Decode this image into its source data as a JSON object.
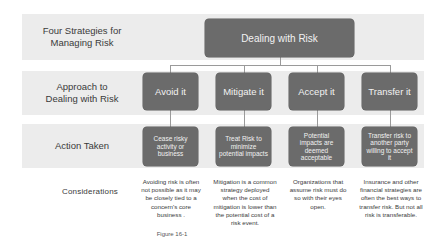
{
  "diagram": {
    "rows": {
      "strategies_label": "Four Strategies for Managing Risk",
      "approach_label": "Approach to Dealing with Risk",
      "action_label": "Action Taken",
      "considerations_label": "Considerations"
    },
    "root": "Dealing with Risk",
    "strategies": [
      {
        "approach": "Avoid it",
        "action": "Cease risky activity or business",
        "consideration": "Avoiding risk is often not possible as it may be closely tied to a concern's core business ."
      },
      {
        "approach": "Mitigate it",
        "action": "Treat Risk to minimize potential impacts",
        "consideration": "Mitigation is a common strategy deployed when the cost of mitigation is lower than the potential cost of a risk event."
      },
      {
        "approach": "Accept it",
        "action": "Potential impacts are deemed acceptable",
        "consideration": "Organizations that assume risk must do so with their eyes open."
      },
      {
        "approach": "Transfer it",
        "action": "Transfer risk to another party willing to accept it",
        "consideration": "Insurance and other financial strategies are often the best ways to transfer risk. But not all risk is transferable."
      }
    ],
    "caption": "Figure 16-1",
    "colors": {
      "box_fill": "#6b6b6b",
      "band_fill": "#ececec",
      "connector": "#9a9a9a"
    }
  }
}
